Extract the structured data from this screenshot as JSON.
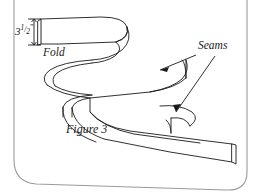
{
  "figure": {
    "caption": "Figure 3",
    "background_color": "#ffffff",
    "ink_color": "#1a1a1a",
    "frame": {
      "name": "rounded-page-border",
      "color": "#8c8c8c"
    },
    "annotations": {
      "dimension": {
        "name": "height-dimension",
        "whole": "3",
        "numerator": "1",
        "slash": "/",
        "denominator": "2",
        "unit": "”",
        "full_text": "3 1/2”"
      },
      "fold_label": "Fold",
      "seams_label": "Seams"
    }
  }
}
